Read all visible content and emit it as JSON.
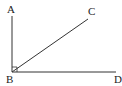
{
  "diagram": {
    "type": "geometry-angle",
    "points": {
      "A": {
        "label": "A",
        "x": 12,
        "y": 16
      },
      "B": {
        "label": "B",
        "x": 12,
        "y": 72
      },
      "C": {
        "label": "C",
        "x": 88,
        "y": 19
      },
      "D": {
        "label": "D",
        "x": 116,
        "y": 72
      }
    },
    "segments": [
      "BA",
      "BC",
      "BD"
    ],
    "right_angle_at": "B",
    "stroke_color": "#333333"
  }
}
